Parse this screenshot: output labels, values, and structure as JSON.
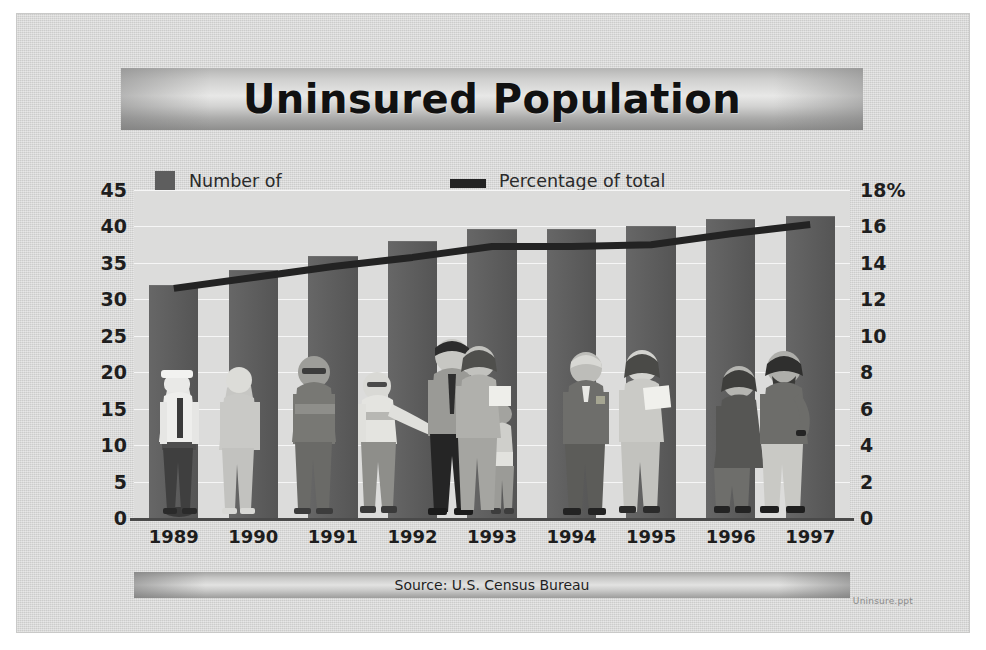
{
  "slide": {
    "title": "Uninsured Population",
    "source_note": "Source:  U.S. Census Bureau",
    "file_watermark": "Uninsure.ppt"
  },
  "legend": {
    "bars": {
      "label": "Number of\nuninsured (millions)",
      "swatch": "bar-swatch",
      "color": "#5e5e5e"
    },
    "line": {
      "label": "Percentage of total\npopulation",
      "swatch": "line-swatch",
      "color": "#232323"
    }
  },
  "colors": {
    "slide_background": "#d3d3d2",
    "plot_background": "#dcdcdb",
    "bar_fill": "#5b5b5b",
    "line_stroke": "#232323",
    "axis_text": "#1e1e1e"
  },
  "chart_data": {
    "type": "bar",
    "title": "Uninsured Population",
    "xlabel": "",
    "ylabel": "Number of uninsured (millions)",
    "y2label": "Percentage of total population",
    "categories": [
      "1989",
      "1990",
      "1991",
      "1992",
      "1993",
      "1994",
      "1995",
      "1996",
      "1997"
    ],
    "ylim": [
      0,
      45
    ],
    "y2lim": [
      0,
      18
    ],
    "yticks": [
      "45",
      "40",
      "35",
      "30",
      "25",
      "20",
      "15",
      "10",
      "5",
      "0"
    ],
    "ytick_values": [
      45,
      40,
      35,
      30,
      25,
      20,
      15,
      10,
      5,
      0
    ],
    "y2ticks": [
      "18%",
      "16",
      "14",
      "12",
      "10",
      "8",
      "6",
      "4",
      "2",
      "0"
    ],
    "y2tick_values": [
      18,
      16,
      14,
      12,
      10,
      8,
      6,
      4,
      2,
      0
    ],
    "grid": true,
    "legend_position": "top",
    "series": [
      {
        "name": "Number of uninsured (millions)",
        "type": "bar",
        "axis": "left",
        "values": [
          32.0,
          34.0,
          36.0,
          38.0,
          39.7,
          39.7,
          40.0,
          41.0,
          41.5
        ]
      },
      {
        "name": "Percentage of total population",
        "type": "line",
        "axis": "right",
        "values": [
          12.6,
          13.2,
          13.8,
          14.3,
          14.9,
          14.9,
          15.0,
          15.6,
          16.1
        ]
      }
    ],
    "annotations": [
      "Source:  U.S. Census Bureau"
    ]
  }
}
